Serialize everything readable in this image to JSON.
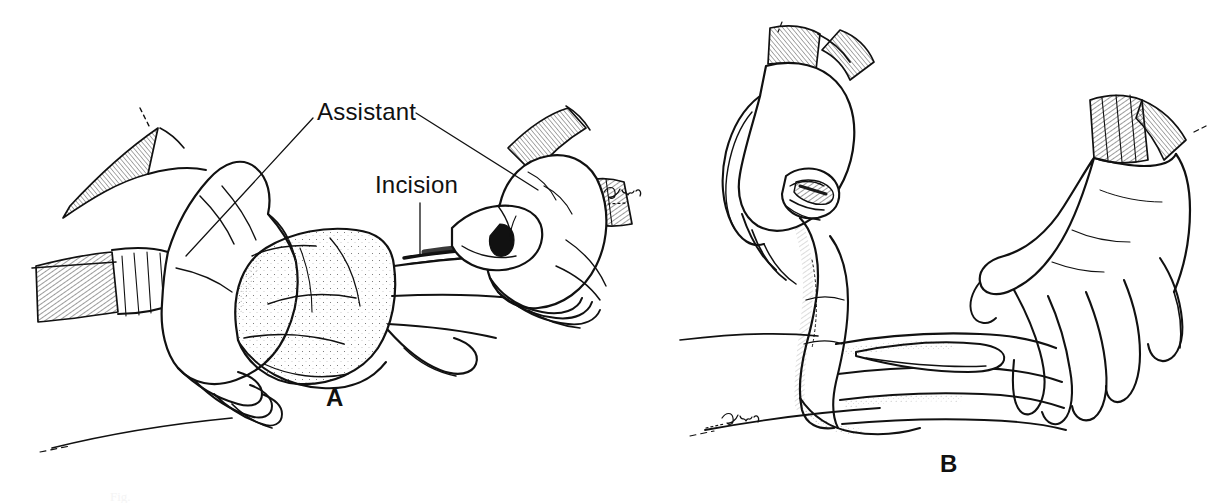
{
  "figure": {
    "kind": "medical-surgical-line-illustration",
    "background_color": "#ffffff",
    "ink_color": "#111111",
    "width": 1225,
    "height": 503,
    "panels": [
      {
        "letter": "A",
        "description": "Two gloved hands of an assistant retracting tissue while the surgeon's hand makes an incision with a scalpel",
        "labels": [
          "Assistant",
          "Incision"
        ]
      },
      {
        "letter": "B",
        "description": "Surgeon's hand holding an instrument over the operative site while the other hand steadies the flap",
        "labels": []
      }
    ],
    "annotations": {
      "assistant_label": "Assistant",
      "incision_label": "Incision"
    },
    "panel_letters": {
      "a": "A",
      "b": "B"
    },
    "signature": "Rith",
    "caption_fragment": "Fig."
  }
}
